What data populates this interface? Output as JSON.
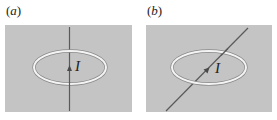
{
  "figure": {
    "panels": [
      {
        "id": "a",
        "label_open": "(",
        "label_letter": "a",
        "label_close": ")",
        "current_symbol": "I",
        "wire_orientation": "vertical"
      },
      {
        "id": "b",
        "label_open": "(",
        "label_letter": "b",
        "label_close": ")",
        "current_symbol": "I",
        "wire_orientation": "diagonal"
      }
    ],
    "colors": {
      "background_panel": "#c4c4c4",
      "loop": "#f2f2f2",
      "loop_outline": "#8a8a8a",
      "wire": "#5a5a5a",
      "text": "#222222"
    }
  }
}
